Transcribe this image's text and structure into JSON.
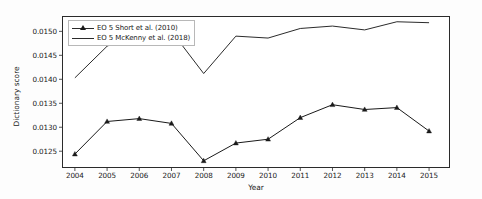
{
  "chart_data": {
    "type": "line",
    "title": "",
    "xlabel": "Year",
    "ylabel": "Dictionary score",
    "grid": false,
    "legend_position": "upper left",
    "categories": [
      2004,
      2005,
      2006,
      2007,
      2008,
      2009,
      2010,
      2011,
      2012,
      2013,
      2014,
      2015
    ],
    "x_tick_labels": [
      "2004",
      "2005",
      "2006",
      "2007",
      "2008",
      "2009",
      "2010",
      "2011",
      "2012",
      "2013",
      "2014",
      "2015"
    ],
    "y_tick_labels": [
      "0.0125",
      "0.0130",
      "0.0135",
      "0.0140",
      "0.0145",
      "0.0150"
    ],
    "y_tick_values": [
      0.0125,
      0.013,
      0.0135,
      0.014,
      0.0145,
      0.015
    ],
    "xlim": [
      2003.6,
      2015.65
    ],
    "ylim": [
      0.01215,
      0.01532
    ],
    "series": [
      {
        "name": "EO 5 Short et al. (2010)",
        "marker": "triangle-up",
        "color": "#1a1a1a",
        "values": [
          0.01244,
          0.01312,
          0.01318,
          0.01308,
          0.0123,
          0.01267,
          0.01275,
          0.0132,
          0.01347,
          0.01337,
          0.01341,
          0.01292
        ]
      },
      {
        "name": "EO 5 McKenny et al. (2018)",
        "marker": "none",
        "color": "#2b2b2b",
        "values": [
          0.01403,
          0.01469,
          0.01498,
          0.015,
          0.01412,
          0.0149,
          0.01486,
          0.01506,
          0.01511,
          0.01503,
          0.0152,
          0.01518
        ]
      }
    ]
  },
  "legend": {
    "items": [
      {
        "label": "EO 5 Short et al. (2010)",
        "marker": "triangle-up"
      },
      {
        "label": "EO 5 McKenny et al. (2018)",
        "marker": "none"
      }
    ]
  }
}
